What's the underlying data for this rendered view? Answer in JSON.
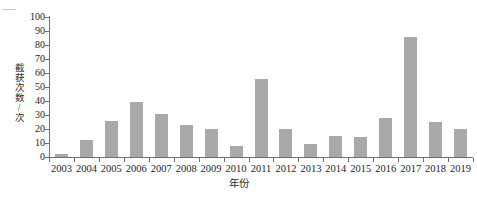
{
  "chart_data": {
    "type": "bar",
    "title": "",
    "xlabel": "年份",
    "ylabel": "截获次数/次",
    "categories": [
      "2003",
      "2004",
      "2005",
      "2006",
      "2007",
      "2008",
      "2009",
      "2010",
      "2011",
      "2012",
      "2013",
      "2014",
      "2015",
      "2016",
      "2017",
      "2018",
      "2019"
    ],
    "values": [
      2,
      12,
      26,
      39,
      31,
      23,
      20,
      8,
      56,
      20,
      9,
      15,
      14,
      28,
      86,
      25,
      20
    ],
    "ylim": [
      0,
      100
    ],
    "ytick_labels": [
      "0",
      "10",
      "20",
      "30",
      "40",
      "50",
      "60",
      "70",
      "80",
      "90",
      "100"
    ],
    "ytick_values": [
      0,
      10,
      20,
      30,
      40,
      50,
      60,
      70,
      80,
      90,
      100
    ],
    "grid": false,
    "legend": null,
    "legend_position": "none",
    "series": [
      {
        "name": "截获次数/次",
        "color": "#a9a9a9",
        "values": [
          2,
          12,
          26,
          39,
          31,
          23,
          20,
          8,
          56,
          20,
          9,
          15,
          14,
          28,
          86,
          25,
          20
        ]
      }
    ]
  },
  "colors": {
    "bar": "#a9a9a9",
    "axis": "#6f6f6f",
    "text": "#1e1e1e"
  }
}
